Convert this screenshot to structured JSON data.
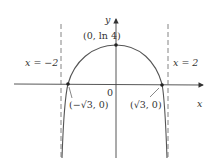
{
  "figure": {
    "axis_labels": {
      "x": "x",
      "y": "y",
      "origin": "0"
    },
    "asymptotes": [
      {
        "label": "x = −2",
        "value": -2
      },
      {
        "label": "x = 2",
        "value": 2
      }
    ],
    "points": [
      {
        "label": "(0, ln 4)",
        "x": 0,
        "y": "ln 4"
      },
      {
        "label": "(−√3, 0)",
        "x": "−√3",
        "y": 0
      },
      {
        "label": "(√3, 0)",
        "x": "√3",
        "y": 0
      }
    ],
    "curve": "y = ln(4 − x²)",
    "colors": {
      "curve": "#555555",
      "axis": "#444444",
      "asymptote": "#777777",
      "text": "#333333"
    }
  }
}
